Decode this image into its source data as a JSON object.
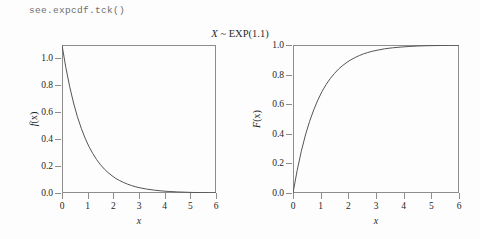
{
  "console": {
    "command": "see.expcdf.tck()"
  },
  "figure": {
    "title": "X ~ EXP(1.1)",
    "title_variable": "X",
    "title_rest": " ~ EXP(1.1)",
    "background_color": "#fdfdfd",
    "frame_color": "#8d8d8d",
    "curve_color": "#555555"
  },
  "panels": [
    {
      "id": "pdf-panel",
      "ylabel": "f (x)",
      "ylabel_fn": "f",
      "ylabel_arg": "(x)",
      "xlabel": "x",
      "ytick_labels": [
        "0.0",
        "0.2",
        "0.4",
        "0.6",
        "0.8",
        "1.0"
      ],
      "ytick_values": [
        0.0,
        0.2,
        0.4,
        0.6,
        0.8,
        1.0
      ],
      "xtick_labels": [
        "0",
        "1",
        "2",
        "3",
        "4",
        "5",
        "6"
      ],
      "xtick_values": [
        0,
        1,
        2,
        3,
        4,
        5,
        6
      ]
    },
    {
      "id": "cdf-panel",
      "ylabel": "F (x)",
      "ylabel_fn": "F",
      "ylabel_arg": "(x)",
      "xlabel": "x",
      "ytick_labels": [
        "0.0",
        "0.2",
        "0.4",
        "0.6",
        "0.8",
        "1.0"
      ],
      "ytick_values": [
        0.0,
        0.2,
        0.4,
        0.6,
        0.8,
        1.0
      ],
      "xtick_labels": [
        "0",
        "1",
        "2",
        "3",
        "4",
        "5",
        "6"
      ],
      "xtick_values": [
        0,
        1,
        2,
        3,
        4,
        5,
        6
      ]
    }
  ],
  "chart_data": [
    {
      "type": "line",
      "id": "pdf-panel",
      "title": "X ~ EXP(1.1)",
      "xlabel": "x",
      "ylabel": "f (x)",
      "distribution": "Exponential",
      "rate": 1.1,
      "function": "pdf",
      "xlim": [
        0,
        6
      ],
      "ylim": [
        0.0,
        1.1
      ],
      "grid": false,
      "legend": "none",
      "xticks": [
        0,
        1,
        2,
        3,
        4,
        5,
        6
      ],
      "yticks": [
        0.0,
        0.2,
        0.4,
        0.6,
        0.8,
        1.0
      ],
      "x": [
        0,
        0.15,
        0.3,
        0.45,
        0.6,
        0.75,
        0.9,
        1.05,
        1.2,
        1.35,
        1.5,
        1.65,
        1.8,
        1.95,
        2.1,
        2.25,
        2.4,
        2.55,
        2.7,
        2.85,
        3,
        3.3,
        3.6,
        3.9,
        4.2,
        4.5,
        4.8,
        5.1,
        5.4,
        5.7,
        6
      ],
      "values": [
        1.1,
        0.932,
        0.79,
        0.669,
        0.567,
        0.481,
        0.408,
        0.345,
        0.293,
        0.248,
        0.21,
        0.178,
        0.151,
        0.128,
        0.108,
        0.092,
        0.078,
        0.066,
        0.056,
        0.047,
        0.04,
        0.029,
        0.021,
        0.015,
        0.011,
        0.008,
        0.006,
        0.004,
        0.003,
        0.002,
        0.0015
      ]
    },
    {
      "type": "line",
      "id": "cdf-panel",
      "title": "X ~ EXP(1.1)",
      "xlabel": "x",
      "ylabel": "F (x)",
      "distribution": "Exponential",
      "rate": 1.1,
      "function": "cdf",
      "xlim": [
        0,
        6
      ],
      "ylim": [
        0.0,
        1.0
      ],
      "grid": false,
      "legend": "none",
      "xticks": [
        0,
        1,
        2,
        3,
        4,
        5,
        6
      ],
      "yticks": [
        0.0,
        0.2,
        0.4,
        0.6,
        0.8,
        1.0
      ],
      "x": [
        0,
        0.15,
        0.3,
        0.45,
        0.6,
        0.75,
        0.9,
        1.05,
        1.2,
        1.35,
        1.5,
        1.65,
        1.8,
        1.95,
        2.1,
        2.25,
        2.4,
        2.55,
        2.7,
        2.85,
        3,
        3.3,
        3.6,
        3.9,
        4.2,
        4.5,
        4.8,
        5.1,
        5.4,
        5.7,
        6
      ],
      "values": [
        0,
        0.152,
        0.282,
        0.392,
        0.484,
        0.562,
        0.629,
        0.686,
        0.734,
        0.774,
        0.808,
        0.838,
        0.862,
        0.883,
        0.901,
        0.916,
        0.929,
        0.94,
        0.949,
        0.957,
        0.963,
        0.974,
        0.981,
        0.986,
        0.99,
        0.993,
        0.995,
        0.996,
        0.997,
        0.998,
        0.999
      ]
    }
  ]
}
